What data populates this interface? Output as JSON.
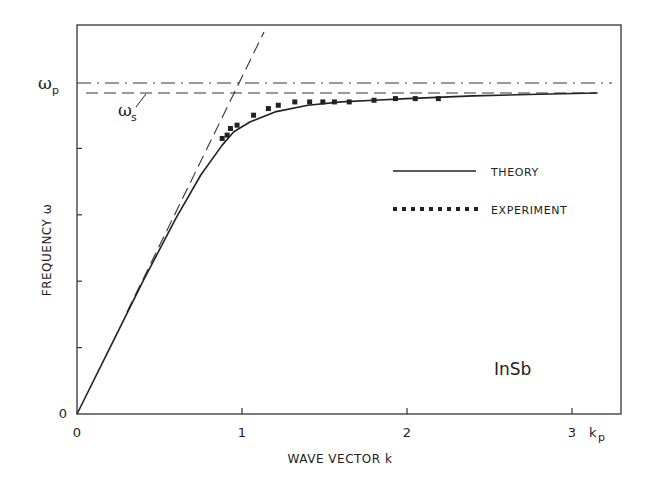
{
  "chart_data": {
    "type": "line",
    "title": "",
    "xlabel": "WAVE VECTOR k",
    "ylabel": "FREQUENCY ω",
    "xlim": [
      0,
      3.3
    ],
    "ylim": [
      0,
      1.18
    ],
    "x_unit_label": "k",
    "x_unit_subscript": "p",
    "x_ticks": [
      0,
      1,
      2,
      3
    ],
    "x_tick_labels": [
      "0",
      "1",
      "2",
      "3"
    ],
    "y_ticks": [
      0,
      0.2,
      0.4,
      0.6,
      0.8,
      1.0
    ],
    "y_tick_labels": [
      "0",
      "",
      "",
      "",
      "",
      "ωp"
    ],
    "grid": false,
    "annotation": "InSb",
    "legend": {
      "position": "right-middle",
      "entries": [
        {
          "label": "THEORY",
          "style": "solid"
        },
        {
          "label": "EXPERIMENT",
          "style": "square-markers"
        }
      ]
    },
    "reference_lines": [
      {
        "name": "ωp",
        "label": "ω",
        "sub": "p",
        "y": 1.0,
        "style": "dash-dot"
      },
      {
        "name": "ωs",
        "label": "ω",
        "sub": "s",
        "y": 0.97,
        "style": "dashed"
      },
      {
        "name": "light-line asymptote",
        "style": "dashed",
        "x": [
          0.3,
          1.13
        ],
        "y": [
          0.31,
          1.15
        ]
      }
    ],
    "series": [
      {
        "name": "THEORY",
        "style": "solid",
        "x": [
          0,
          0.2,
          0.4,
          0.6,
          0.75,
          0.88,
          0.95,
          1.05,
          1.2,
          1.4,
          1.6,
          1.8,
          2.0,
          2.4,
          2.8,
          3.15
        ],
        "y": [
          0,
          0.2,
          0.4,
          0.59,
          0.72,
          0.81,
          0.85,
          0.88,
          0.91,
          0.93,
          0.94,
          0.945,
          0.95,
          0.958,
          0.963,
          0.967
        ]
      },
      {
        "name": "EXPERIMENT",
        "style": "square-markers",
        "x": [
          0.88,
          0.91,
          0.93,
          0.97,
          1.07,
          1.16,
          1.22,
          1.32,
          1.41,
          1.49,
          1.56,
          1.65,
          1.8,
          1.93,
          2.05,
          2.19
        ],
        "y": [
          0.83,
          0.84,
          0.86,
          0.87,
          0.9,
          0.92,
          0.93,
          0.94,
          0.94,
          0.94,
          0.94,
          0.94,
          0.945,
          0.95,
          0.95,
          0.95
        ]
      }
    ]
  }
}
